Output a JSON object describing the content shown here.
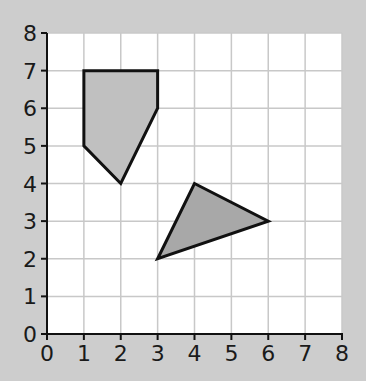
{
  "chart_data": {
    "type": "scatter",
    "title": "",
    "xlabel": "",
    "ylabel": "",
    "xlim": [
      0,
      8
    ],
    "ylim": [
      0,
      8
    ],
    "grid": true,
    "x_ticks": [
      "0",
      "1",
      "2",
      "3",
      "4",
      "5",
      "6",
      "7",
      "8"
    ],
    "y_ticks": [
      "0",
      "1",
      "2",
      "3",
      "4",
      "5",
      "6",
      "7",
      "8"
    ],
    "shapes": [
      {
        "name": "pentagon",
        "fill": "#c0c0c0",
        "vertices": [
          [
            1,
            7
          ],
          [
            3,
            7
          ],
          [
            3,
            6
          ],
          [
            2,
            4
          ],
          [
            1,
            5
          ]
        ]
      },
      {
        "name": "triangle",
        "fill": "#a8a8a8",
        "vertices": [
          [
            4,
            4
          ],
          [
            6,
            3
          ],
          [
            3,
            2
          ]
        ]
      }
    ]
  },
  "colors": {
    "background": "#cdcdcd",
    "grid": "#c8c8c8",
    "plot_bg": "#ffffff",
    "outline": "#111111"
  }
}
